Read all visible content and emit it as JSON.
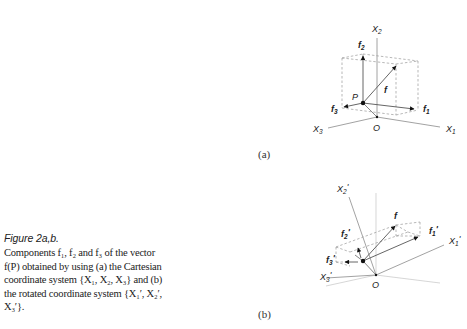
{
  "caption": {
    "title": "Figure 2a,b.",
    "body_lines": [
      "Components f₁, f₂ and f₃ of the vector",
      "f(P) obtained by using (a) the Cartesian",
      "coordinate system {X₁, X₂, X₃} and (b)",
      "the rotated coordinate system {X₁′, X₂′,",
      "X₃′}."
    ]
  },
  "panels": {
    "a": {
      "label": "(a)",
      "axes": {
        "x1": "X1",
        "x2": "X2",
        "x3": "X3"
      },
      "origin": "O",
      "point": "P",
      "vector": "f",
      "components": {
        "f1": "f1",
        "f2": "f2",
        "f3": "f3"
      }
    },
    "b": {
      "label": "(b)",
      "axes": {
        "x1": "X1'",
        "x2": "X2'",
        "x3": "X3'"
      },
      "origin": "O",
      "vector": "f",
      "components": {
        "f1": "f1'",
        "f2": "f2'",
        "f3": "f3'"
      }
    }
  },
  "colors": {
    "axis": "#8a8a8a",
    "vector": "#555555",
    "arrow": "#111111",
    "dash": "#9a9a9a",
    "text": "#222222"
  }
}
